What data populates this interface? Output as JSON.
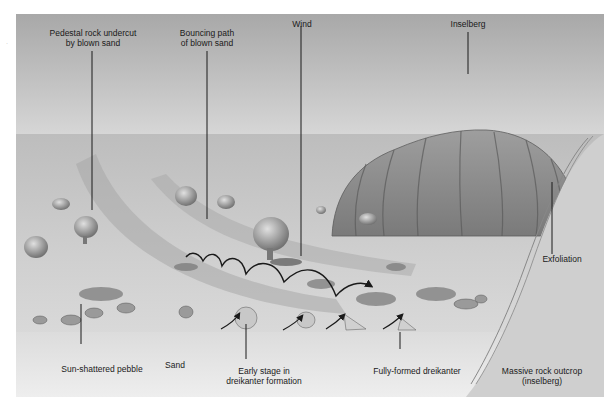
{
  "diagram": {
    "colors": {
      "sky_top": "#a9a9a9",
      "sky_bottom": "#d6d6d6",
      "plain": "#c9c9c9",
      "foreground_sand": "#e6e6e6",
      "inselberg": "#9a9a9a",
      "outcrop": "#d0d0d0",
      "line": "#1a1a1a"
    },
    "labels": {
      "pedestal_rock": {
        "line1": "Pedestal rock undercut",
        "line2": "by blown sand"
      },
      "bouncing_path": {
        "line1": "Bouncing path",
        "line2": "of blown sand"
      },
      "wind": {
        "line1": "Wind"
      },
      "inselberg": {
        "line1": "Inselberg"
      },
      "exfoliation": {
        "line1": "Exfoliation"
      },
      "sun_shattered_pebble": {
        "line1": "Sun-shattered pebble"
      },
      "sand": {
        "line1": "Sand"
      },
      "early_stage": {
        "line1": "Early stage in",
        "line2": "dreikanter formation"
      },
      "fully_formed": {
        "line1": "Fully-formed dreikanter"
      },
      "massive_outcrop": {
        "line1": "Massive rock outcrop",
        "line2": "(inselberg)"
      }
    },
    "margin_mark": "·"
  }
}
